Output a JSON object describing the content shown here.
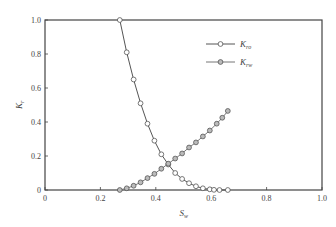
{
  "chart_data": {
    "type": "line",
    "title": "",
    "xlabel": "S_w",
    "ylabel": "K_r",
    "xlim": [
      0,
      1.0
    ],
    "ylim": [
      0,
      1.0
    ],
    "xticks": [
      "0",
      "0.2",
      "0.4",
      "0.6",
      "0.8",
      "1.0"
    ],
    "yticks": [
      "0",
      "0.2",
      "0.4",
      "0.6",
      "0.8",
      "1.0"
    ],
    "grid": false,
    "legend_position": "upper right",
    "series": [
      {
        "name": "K_ro",
        "marker": "open-circle",
        "color": "#555555",
        "x": [
          0.27,
          0.295,
          0.32,
          0.345,
          0.37,
          0.395,
          0.42,
          0.445,
          0.47,
          0.495,
          0.52,
          0.545,
          0.57,
          0.595,
          0.61,
          0.63,
          0.66
        ],
        "y": [
          1.0,
          0.81,
          0.65,
          0.51,
          0.39,
          0.29,
          0.21,
          0.15,
          0.1,
          0.065,
          0.04,
          0.022,
          0.01,
          0.004,
          0.001,
          0.0,
          0.0
        ]
      },
      {
        "name": "K_rw",
        "marker": "gray-filled-circle",
        "color": "#777777",
        "x": [
          0.27,
          0.295,
          0.32,
          0.345,
          0.37,
          0.395,
          0.42,
          0.445,
          0.47,
          0.495,
          0.52,
          0.545,
          0.57,
          0.595,
          0.62,
          0.64,
          0.66
        ],
        "y": [
          0.0,
          0.01,
          0.025,
          0.045,
          0.07,
          0.095,
          0.125,
          0.155,
          0.185,
          0.215,
          0.25,
          0.28,
          0.315,
          0.35,
          0.39,
          0.425,
          0.465
        ]
      }
    ]
  },
  "legend": {
    "items": [
      {
        "main": "K",
        "sub": "ro"
      },
      {
        "main": "K",
        "sub": "rw"
      }
    ]
  },
  "axes": {
    "x_label_main": "S",
    "x_label_sub": "w",
    "y_label_main": "K",
    "y_label_sub": "r"
  }
}
